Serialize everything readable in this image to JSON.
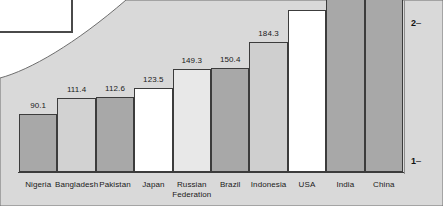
{
  "chart_data": {
    "type": "bar",
    "title": "",
    "subtitle": "",
    "xlabel": "",
    "ylabel": "",
    "categories": [
      "Nigeria",
      "Bangladesh",
      "Pakistan",
      "Japan",
      "Russian\nFederation",
      "Brazil",
      "Indonesia",
      "USA",
      "India",
      "China"
    ],
    "values": [
      90.1,
      111.4,
      112.6,
      123.5,
      149.3,
      150.4,
      184.3,
      null,
      null,
      null
    ],
    "value_labels": [
      "90.1",
      "111.4",
      "112.6",
      "123.5",
      "149.3",
      "150.4",
      "184.3",
      "",
      "",
      ""
    ],
    "bar_colors": [
      "#a8a8a8",
      "#d2d2d2",
      "#a8a8a8",
      "#ffffff",
      "#e8e8e8",
      "#a8a8a8",
      "#cfcfcf",
      "#ffffff",
      "#a8a8a8",
      "#a8a8a8"
    ],
    "axis_ticks": [
      "2",
      "1"
    ],
    "axis_side": "right",
    "grid": false,
    "legend": "none"
  },
  "axis": {
    "ticks": [
      {
        "label": "2",
        "dash": "–"
      },
      {
        "label": "1",
        "dash": "–"
      }
    ]
  },
  "colors": {
    "plot_background": "#d9d9d9",
    "page_background": "#ffffff",
    "bar_outline": "#3c3c3c",
    "panel_border": "#4a4a4a",
    "text": "#1a1a1a"
  }
}
